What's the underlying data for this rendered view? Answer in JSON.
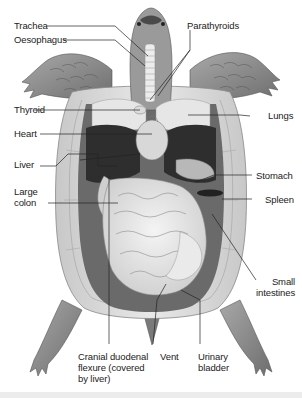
{
  "figure": {
    "colors": {
      "background": "#ffffff",
      "skin": "#8a8a8a",
      "shell": "#d4d4d4",
      "organ_light": "#e2e2e2",
      "organ_dark": "#2e2e2e",
      "leader_line": "#222222",
      "text": "#222222"
    }
  },
  "labels": {
    "trachea": "Trachea",
    "oesophagus": "Oesophagus",
    "parathyroids": "Parathyroids",
    "thyroid": "Thyroid",
    "lungs": "Lungs",
    "heart": "Heart",
    "liver": "Liver",
    "stomach": "Stomach",
    "large_colon": "Large\ncolon",
    "spleen": "Spleen",
    "small_intestines": "Small\nintestines",
    "cranial_duodenal_flexure": "Cranial duodenal\nflexure (covered\nby liver)",
    "vent": "Vent",
    "urinary_bladder": "Urinary\nbladder"
  }
}
